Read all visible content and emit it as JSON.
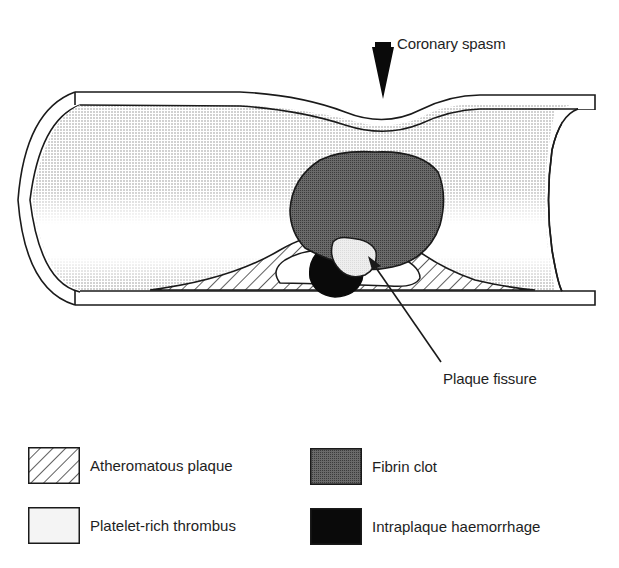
{
  "figure": {
    "annotations": {
      "coronary_spasm": "Coronary spasm",
      "plaque_fissure": "Plaque fissure"
    },
    "colors": {
      "outline": "#1a1a1a",
      "lumen_stipple": "#9a9a9a",
      "fibrin_clot": "#5a5a5a",
      "platelet_thrombus": "#e6e6e6",
      "haemorrhage": "#0a0a0a",
      "background": "#ffffff"
    }
  },
  "legend": {
    "items": [
      {
        "label": "Atheromatous plaque",
        "pattern": "hatched"
      },
      {
        "label": "Fibrin clot",
        "pattern": "dark-stipple"
      },
      {
        "label": "Platelet-rich thrombus",
        "pattern": "light-fill"
      },
      {
        "label": "Intraplaque haemorrhage",
        "pattern": "solid-black"
      }
    ]
  }
}
